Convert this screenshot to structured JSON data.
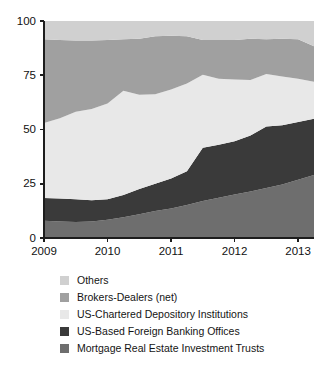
{
  "chart_data": {
    "type": "area",
    "stacked": true,
    "normalized_percent": true,
    "title": "",
    "subtitle": "",
    "xlabel": "",
    "ylabel": "",
    "xlim": [
      2009.0,
      2013.25
    ],
    "ylim": [
      0,
      100
    ],
    "yticks": [
      0,
      25,
      50,
      75,
      100
    ],
    "ytick_labels": [
      "0",
      "25",
      "50",
      "75",
      "100"
    ],
    "xticks": [
      2009,
      2010,
      2011,
      2012,
      2013
    ],
    "xtick_labels": [
      "2009",
      "2010",
      "2011",
      "2012",
      "2013"
    ],
    "grid": false,
    "legend_position": "bottom",
    "x": [
      2009.0,
      2009.25,
      2009.5,
      2009.75,
      2010.0,
      2010.25,
      2010.5,
      2010.75,
      2011.0,
      2011.25,
      2011.5,
      2011.75,
      2012.0,
      2012.25,
      2012.5,
      2012.75,
      2013.0,
      2013.25
    ],
    "series": [
      {
        "name": "Mortgage Real Estate Investment Trusts",
        "color": "#6e6e6e",
        "values": [
          8.0,
          7.6,
          7.4,
          7.6,
          8.4,
          9.6,
          11.0,
          12.4,
          13.6,
          15.2,
          17.0,
          18.6,
          20.0,
          21.4,
          23.0,
          24.6,
          26.8,
          29.0
        ]
      },
      {
        "name": "US-Based Foreign Banking Offices",
        "color": "#3a3a3a",
        "values": [
          10.4,
          10.6,
          10.4,
          9.8,
          9.4,
          10.2,
          11.6,
          12.6,
          13.8,
          15.6,
          24.6,
          24.4,
          24.6,
          25.8,
          28.4,
          27.4,
          26.6,
          26.0
        ]
      },
      {
        "name": "US-Chartered Depository Institutions",
        "color": "#e8e8e8",
        "values": [
          34.6,
          37.0,
          40.4,
          42.0,
          44.2,
          48.0,
          43.4,
          41.2,
          41.0,
          40.4,
          33.6,
          30.4,
          28.4,
          25.6,
          24.2,
          22.4,
          20.0,
          17.0
        ]
      },
      {
        "name": "Brokers-Dealers (net)",
        "color": "#a0a0a0",
        "values": [
          38.6,
          36.0,
          32.8,
          31.6,
          29.2,
          23.8,
          25.8,
          26.8,
          24.8,
          21.8,
          16.0,
          17.8,
          18.2,
          19.0,
          16.0,
          17.4,
          18.2,
          16.4
        ]
      },
      {
        "name": "Others",
        "color": "#d0d0d0",
        "values": [
          8.4,
          8.8,
          9.0,
          9.0,
          8.8,
          8.4,
          8.2,
          7.0,
          6.8,
          7.0,
          8.8,
          8.8,
          8.8,
          8.2,
          8.4,
          8.2,
          8.4,
          11.6
        ]
      }
    ],
    "cumulative_tops": {
      "note": "running totals per x, bottom-to-top stacking order",
      "mortgage_reits": [
        8.0,
        7.6,
        7.4,
        7.6,
        8.4,
        9.6,
        11.0,
        12.4,
        13.6,
        15.2,
        17.0,
        18.6,
        20.0,
        21.4,
        23.0,
        24.6,
        26.8,
        29.0
      ],
      "us_based_foreign_banking": [
        18.4,
        18.2,
        17.8,
        17.4,
        17.8,
        19.8,
        22.6,
        25.0,
        27.4,
        30.8,
        41.6,
        43.0,
        44.6,
        47.2,
        51.4,
        52.0,
        53.4,
        55.0
      ],
      "us_chartered_depository": [
        53.0,
        55.2,
        58.2,
        59.4,
        62.0,
        67.8,
        66.0,
        66.2,
        68.4,
        71.2,
        75.2,
        73.4,
        73.0,
        72.8,
        75.6,
        74.4,
        73.4,
        72.0
      ],
      "brokers_dealers": [
        91.6,
        91.2,
        91.0,
        91.0,
        91.2,
        91.6,
        91.8,
        93.0,
        93.2,
        93.0,
        91.2,
        91.2,
        91.2,
        91.8,
        91.6,
        91.8,
        91.6,
        88.4
      ],
      "others": [
        100,
        100,
        100,
        100,
        100,
        100,
        100,
        100,
        100,
        100,
        100,
        100,
        100,
        100,
        100,
        100,
        100,
        100
      ]
    }
  },
  "legend": {
    "items": [
      {
        "label": "Others",
        "color": "#d0d0d0"
      },
      {
        "label": "Brokers-Dealers (net)",
        "color": "#a0a0a0"
      },
      {
        "label": "US-Chartered Depository Institutions",
        "color": "#e8e8e8"
      },
      {
        "label": "US-Based Foreign Banking Offices",
        "color": "#3a3a3a"
      },
      {
        "label": "Mortgage Real Estate Investment Trusts",
        "color": "#6e6e6e"
      }
    ]
  },
  "axis": {
    "y_labels": [
      "100",
      "75",
      "50",
      "25",
      "0"
    ],
    "x_labels": [
      "2009",
      "2010",
      "2011",
      "2012",
      "2013"
    ]
  }
}
